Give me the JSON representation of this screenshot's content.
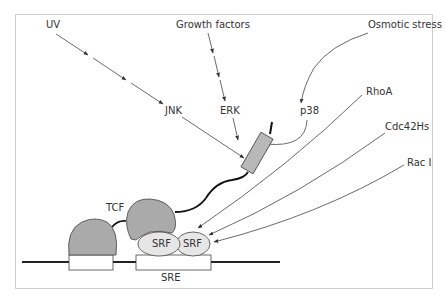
{
  "diagram": {
    "title": "",
    "labels": {
      "uv": "UV",
      "growth_factors": "Growth factors",
      "osmotic_stress": "Osmotic stress",
      "jnk": "JNK",
      "erk": "ERK",
      "p38": "p38",
      "rhoa": "RhoA",
      "cdc42hs": "Cdc42Hs",
      "rac1": "Rac I",
      "tcf": "TCF",
      "srf1": "SRF",
      "srf2": "SRF",
      "sre": "SRE"
    },
    "colors": {
      "frame": "#cfcfcf",
      "tcf_fill": "#aaaaaa",
      "srf_fill": "#e6e6e6",
      "box_fill": "#b8b8b8",
      "line": "#333333",
      "dna": "#222222"
    },
    "edges": [
      {
        "from": "UV",
        "to": "JNK"
      },
      {
        "from": "JNK",
        "to": "TCF-activation-domain"
      },
      {
        "from": "Growth factors",
        "to": "ERK"
      },
      {
        "from": "ERK",
        "to": "TCF-activation-domain"
      },
      {
        "from": "Osmotic stress",
        "to": "p38"
      },
      {
        "from": "p38",
        "to": "TCF-activation-domain"
      },
      {
        "from": "RhoA",
        "to": "SRF"
      },
      {
        "from": "Cdc42Hs",
        "to": "SRF"
      },
      {
        "from": "Rac I",
        "to": "SRF"
      }
    ]
  }
}
